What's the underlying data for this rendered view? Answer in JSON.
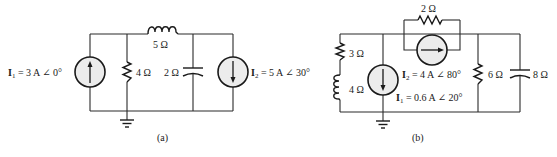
{
  "circuit_a": {
    "caption": "(a)",
    "source1": {
      "name": "I",
      "sub": "1",
      "eq": " = 3 A ∠ 0°",
      "direction": "up"
    },
    "source2": {
      "name": "I",
      "sub": "2",
      "eq": " = 5 A ∠ 30°",
      "direction": "down"
    },
    "inductor": {
      "label": "5 Ω"
    },
    "resistor": {
      "label": "4 Ω"
    },
    "capacitor": {
      "label": "2 Ω"
    }
  },
  "circuit_b": {
    "caption": "(b)",
    "source1": {
      "name": "I",
      "sub": "1",
      "eq": " = 0.6 A ∠ 20°",
      "direction": "down"
    },
    "source2": {
      "name": "I",
      "sub": "2",
      "eq": " = 4 A ∠ 80°",
      "direction": "right"
    },
    "resistor_top": {
      "label": "2 Ω"
    },
    "resistor_left": {
      "label": "3 Ω"
    },
    "inductor_left": {
      "label": "4 Ω"
    },
    "resistor_right": {
      "label": "6 Ω"
    },
    "capacitor": {
      "label": "8 Ω"
    }
  },
  "colors": {
    "wire": "#2a2a2a",
    "source_fill": "#ececec",
    "background": "#ffffff"
  }
}
